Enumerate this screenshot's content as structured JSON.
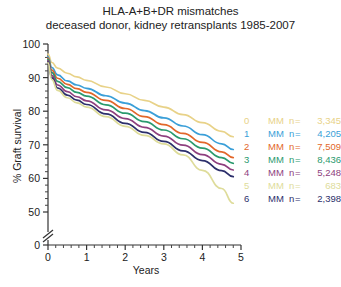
{
  "title": {
    "line1": "HLA-A+B+DR mismatches",
    "line2": "deceased donor, kidney retransplants 1985-2007"
  },
  "axes": {
    "ylabel": "% Graft survival",
    "xlabel": "Years",
    "yticks": [
      "100",
      "90",
      "80",
      "70",
      "60",
      "50",
      "0"
    ],
    "xticks": [
      "0",
      "1",
      "2",
      "3",
      "4",
      "5"
    ],
    "break_marker": "axis-break"
  },
  "legend": [
    {
      "name": "0",
      "mm": "MM",
      "n": "n",
      "eq": "=",
      "value": "3,345",
      "color": "#e8d288"
    },
    {
      "name": "1",
      "mm": "MM",
      "n": "n",
      "eq": "=",
      "value": "4,205",
      "color": "#3a9fd8"
    },
    {
      "name": "2",
      "mm": "MM",
      "n": "n",
      "eq": "=",
      "value": "7,509",
      "color": "#e2672a"
    },
    {
      "name": "3",
      "mm": "MM",
      "n": "n",
      "eq": "=",
      "value": "8,436",
      "color": "#2a9a6e"
    },
    {
      "name": "4",
      "mm": "MM",
      "n": "n",
      "eq": "=",
      "value": "5,248",
      "color": "#8e3f7e"
    },
    {
      "name": "5",
      "mm": "MM",
      "n": "n",
      "eq": "=",
      "value": "683",
      "color": "#dedc9a"
    },
    {
      "name": "6",
      "mm": "MM",
      "n": "n",
      "eq": "=",
      "value": "2,398",
      "color": "#2c2f6b"
    }
  ],
  "chart_data": {
    "type": "line",
    "xlabel": "Years",
    "ylabel": "% Graft survival",
    "xlim": [
      0,
      5
    ],
    "ylim": [
      50,
      100
    ],
    "y_axis_break": true,
    "y_break_to": 0,
    "grid": false,
    "legend_position": "inside-right",
    "x": [
      0,
      0.1,
      0.25,
      0.5,
      0.75,
      1,
      1.5,
      2,
      2.5,
      3,
      3.5,
      4,
      4.5,
      4.8
    ],
    "series": [
      {
        "name": "0 MM",
        "n": 3345,
        "color": "#e8d288",
        "values": [
          97.0,
          94.5,
          92.8,
          91.3,
          90.2,
          89.2,
          87.2,
          85.2,
          83.2,
          81.2,
          79.0,
          76.6,
          74.0,
          72.4
        ]
      },
      {
        "name": "1 MM",
        "n": 4205,
        "color": "#3a9fd8",
        "values": [
          96.2,
          93.0,
          90.8,
          89.0,
          87.8,
          86.8,
          84.6,
          82.4,
          80.2,
          78.0,
          75.6,
          73.0,
          70.3,
          68.6
        ]
      },
      {
        "name": "2 MM",
        "n": 7509,
        "color": "#e2672a",
        "values": [
          95.8,
          92.2,
          89.8,
          88.0,
          86.7,
          85.6,
          83.2,
          80.8,
          78.4,
          76.0,
          73.4,
          70.7,
          67.9,
          66.2
        ]
      },
      {
        "name": "3 MM",
        "n": 8436,
        "color": "#2a9a6e",
        "values": [
          95.4,
          91.5,
          88.9,
          87.0,
          85.6,
          84.5,
          81.9,
          79.4,
          76.9,
          74.4,
          71.8,
          69.0,
          66.2,
          64.5
        ]
      },
      {
        "name": "4 MM",
        "n": 5248,
        "color": "#8e3f7e",
        "values": [
          95.0,
          90.6,
          87.8,
          85.8,
          84.3,
          83.1,
          80.4,
          77.8,
          75.2,
          72.6,
          69.9,
          67.1,
          64.2,
          62.5
        ]
      },
      {
        "name": "5 MM",
        "n": 683,
        "color": "#dedc9a",
        "values": [
          94.4,
          89.4,
          86.2,
          84.0,
          82.5,
          81.2,
          78.4,
          75.5,
          72.8,
          70.3,
          67.0,
          62.4,
          57.0,
          52.6
        ]
      },
      {
        "name": "6 MM",
        "n": 2398,
        "color": "#2c2f6b",
        "values": [
          94.6,
          89.9,
          86.9,
          84.8,
          83.3,
          82.0,
          79.2,
          76.4,
          73.7,
          71.0,
          68.2,
          65.3,
          62.3,
          60.5
        ]
      }
    ]
  }
}
